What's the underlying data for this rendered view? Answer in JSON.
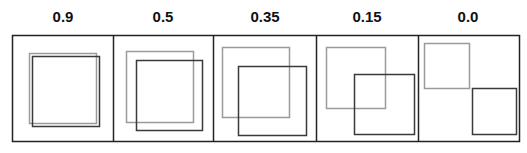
{
  "figure": {
    "colors": {
      "frame": "#222222",
      "box_a": "#9a9a9a",
      "box_b": "#3a3a3a",
      "background": "#ffffff"
    },
    "panels": [
      {
        "label": "0.9",
        "box_a": [
          29,
          53,
          67,
          70
        ],
        "box_b": [
          32,
          56,
          67,
          70
        ]
      },
      {
        "label": "0.5",
        "box_a": [
          126,
          51,
          67,
          71
        ],
        "box_b": [
          136,
          60,
          66,
          70
        ]
      },
      {
        "label": "0.35",
        "box_a": [
          222,
          47,
          67,
          70
        ],
        "box_b": [
          238,
          66,
          68,
          69
        ]
      },
      {
        "label": "0.15",
        "box_a": [
          326,
          47,
          59,
          61
        ],
        "box_b": [
          354,
          74,
          60,
          60
        ]
      },
      {
        "label": "0.0",
        "box_a": [
          424,
          43,
          45,
          45
        ],
        "box_b": [
          472,
          88,
          44,
          46
        ]
      }
    ],
    "frame": {
      "x": 12,
      "y": 35,
      "width": 507,
      "height": 106,
      "dividers": [
        113,
        213,
        316,
        418
      ]
    }
  }
}
